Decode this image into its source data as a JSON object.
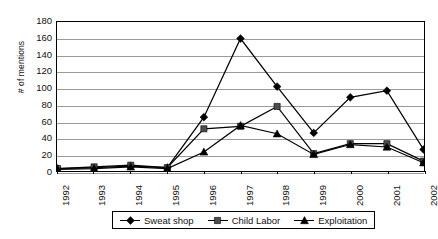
{
  "chart_data": {
    "type": "line",
    "title": "",
    "xlabel": "",
    "ylabel": "# of mentions",
    "categories": [
      "1992",
      "1993",
      "1994",
      "1995",
      "1996",
      "1997",
      "1998",
      "1999",
      "2000",
      "2001",
      "2002"
    ],
    "ylim": [
      0,
      180
    ],
    "ytick_step": 20,
    "yticks": [
      0,
      20,
      40,
      60,
      80,
      100,
      120,
      140,
      160,
      180
    ],
    "grid": true,
    "legend_position": "bottom",
    "series": [
      {
        "name": "Sweat shop",
        "marker": "diamond",
        "color": "#000000",
        "values": [
          3,
          4,
          6,
          4,
          65,
          160,
          102,
          46,
          89,
          97,
          26
        ]
      },
      {
        "name": "Child Labor",
        "marker": "square",
        "color": "#4d4d4d",
        "values": [
          3,
          5,
          7,
          4,
          51,
          54,
          78,
          21,
          33,
          33,
          12
        ]
      },
      {
        "name": "Exploitation",
        "marker": "triangle",
        "color": "#000000",
        "values": [
          2,
          3,
          5,
          3,
          23,
          55,
          45,
          20,
          32,
          29,
          10
        ]
      }
    ]
  }
}
